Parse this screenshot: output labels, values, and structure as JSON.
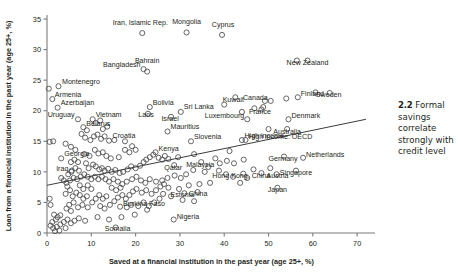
{
  "figure": {
    "caption_number": "2.2",
    "caption_text": "Formal savings correlate strongly with credit level"
  },
  "chart_data": {
    "type": "scatter",
    "title": "",
    "xlabel": "Saved at a financial institution in the past year (age 25+, %)",
    "ylabel": "Loan from a financial institution in the past year (age 25+, %)",
    "xlim": [
      0,
      72
    ],
    "ylim": [
      0,
      35
    ],
    "xticks": [
      0,
      10,
      20,
      30,
      40,
      50,
      60,
      70
    ],
    "yticks": [
      0,
      5,
      10,
      15,
      20,
      25,
      30,
      35
    ],
    "grid": false,
    "legend": null,
    "trendline": {
      "x": [
        0,
        72
      ],
      "y": [
        7.8,
        18.6
      ],
      "label": ""
    },
    "labeled_points": [
      {
        "label": "Iran, Islamic Rep.",
        "x": 21.5,
        "y": 32.7,
        "lx": -2,
        "ly": 8,
        "anchor": "middle"
      },
      {
        "label": "Mongolia",
        "x": 31.5,
        "y": 32.8,
        "lx": 0,
        "ly": 8,
        "anchor": "middle"
      },
      {
        "label": "Cyprus",
        "x": 39.5,
        "y": 32.4,
        "lx": 1,
        "ly": 8,
        "anchor": "middle"
      },
      {
        "label": "Bangladesh",
        "x": 21.8,
        "y": 26.8,
        "lx": -3,
        "ly": 2,
        "anchor": "end"
      },
      {
        "label": "Bahrain",
        "x": 22.6,
        "y": 26.4,
        "lx": 0,
        "ly": 9,
        "anchor": "middle"
      },
      {
        "label": "Montenegro",
        "x": 2.6,
        "y": 24.0,
        "lx": 3.5,
        "ly": 2.5,
        "anchor": "start"
      },
      {
        "label": "Armenia",
        "x": 1.2,
        "y": 21.9,
        "lx": 2.5,
        "ly": 2.5,
        "anchor": "start"
      },
      {
        "label": "Azerbaijan",
        "x": 2.4,
        "y": 20.5,
        "lx": 3,
        "ly": 2.5,
        "anchor": "start"
      },
      {
        "label": "Bolivia",
        "x": 23.2,
        "y": 20.6,
        "lx": 3,
        "ly": 2.5,
        "anchor": "start"
      },
      {
        "label": "Sri Lanka",
        "x": 30.2,
        "y": 19.8,
        "lx": 3,
        "ly": 2.5,
        "anchor": "start"
      },
      {
        "label": "Uruguay",
        "x": 7.0,
        "y": 18.6,
        "lx": -3.5,
        "ly": 2.5,
        "anchor": "end"
      },
      {
        "label": "Vietnam",
        "x": 10.3,
        "y": 18.6,
        "lx": 3,
        "ly": 2.5,
        "anchor": "start"
      },
      {
        "label": "Laos",
        "x": 22.8,
        "y": 19.5,
        "lx": -2,
        "ly": -3.5,
        "anchor": "middle"
      },
      {
        "label": "Israel",
        "x": 28.0,
        "y": 19.0,
        "lx": -1,
        "ly": -4.5,
        "anchor": "middle"
      },
      {
        "label": "Belarus",
        "x": 8.2,
        "y": 17.3,
        "lx": 3,
        "ly": 1.5,
        "anchor": "start"
      },
      {
        "label": "Mauritius",
        "x": 27.2,
        "y": 16.6,
        "lx": 3,
        "ly": 2.5,
        "anchor": "start"
      },
      {
        "label": "Croatia",
        "x": 14.0,
        "y": 15.1,
        "lx": 3.5,
        "ly": 2.5,
        "anchor": "start"
      },
      {
        "label": "Slovenia",
        "x": 32.5,
        "y": 15.0,
        "lx": 3,
        "ly": 2,
        "anchor": "start"
      },
      {
        "label": "High income",
        "x": 44.0,
        "y": 15.2,
        "lx": 2.5,
        "ly": 2,
        "anchor": "start"
      },
      {
        "label": "Georgia",
        "x": 3.2,
        "y": 12.2,
        "lx": 3,
        "ly": 2.5,
        "anchor": "start"
      },
      {
        "label": "Kenya",
        "x": 24.5,
        "y": 13.2,
        "lx": 3,
        "ly": 1.5,
        "anchor": "start"
      },
      {
        "label": "Iraq",
        "x": 5.5,
        "y": 10.0,
        "lx": -3,
        "ly": 1,
        "anchor": "end"
      },
      {
        "label": "Qatar",
        "x": 28.7,
        "y": 11.1,
        "lx": -1,
        "ly": -4.5,
        "anchor": "middle"
      },
      {
        "label": "Malaysia",
        "x": 34.8,
        "y": 11.6,
        "lx": -1,
        "ly": -4.5,
        "anchor": "middle"
      },
      {
        "label": "Kuwait",
        "x": 42.5,
        "y": 22.2,
        "lx": -2,
        "ly": -4.5,
        "anchor": "middle"
      },
      {
        "label": "Canada",
        "x": 50.5,
        "y": 21.6,
        "lx": -3,
        "ly": 1,
        "anchor": "end"
      },
      {
        "label": "France",
        "x": 48.4,
        "y": 20.2,
        "lx": -1.5,
        "ly": -4.5,
        "anchor": "middle"
      },
      {
        "label": "Luxembourg",
        "x": 45.2,
        "y": 18.6,
        "lx": -3,
        "ly": 1,
        "anchor": "end"
      },
      {
        "label": "Finland",
        "x": 56.6,
        "y": 22.2,
        "lx": 3,
        "ly": 1,
        "anchor": "start"
      },
      {
        "label": "Sweden",
        "x": 63.8,
        "y": 22.9,
        "lx": -1,
        "ly": -4.5,
        "anchor": "middle"
      },
      {
        "label": "New Zealand",
        "x": 58.8,
        "y": 28.2,
        "lx": 0,
        "ly": -4.5,
        "anchor": "middle"
      },
      {
        "label": "Denmark",
        "x": 54.5,
        "y": 18.6,
        "lx": 3,
        "ly": 1,
        "anchor": "start"
      },
      {
        "label": "Australia",
        "x": 54.2,
        "y": 17.0,
        "lx": 0,
        "ly": -4.5,
        "anchor": "middle"
      },
      {
        "label": "High income: OECD",
        "x": 44.8,
        "y": 15.2,
        "lx": 3,
        "ly": 1,
        "anchor": "start"
      },
      {
        "label": "Germany",
        "x": 53.5,
        "y": 12.5,
        "lx": -1,
        "ly": -4.5,
        "anchor": "middle"
      },
      {
        "label": "Netherlands",
        "x": 57.8,
        "y": 12.3,
        "lx": 3,
        "ly": 1,
        "anchor": "start"
      },
      {
        "label": "Singapore",
        "x": 56.2,
        "y": 10.2,
        "lx": 0,
        "ly": -4.5,
        "anchor": "middle"
      },
      {
        "label": "Hong Kong, China",
        "x": 44.3,
        "y": 9.7,
        "lx": -2,
        "ly": -4.5,
        "anchor": "middle"
      },
      {
        "label": "Austria",
        "x": 51.8,
        "y": 9.6,
        "lx": 1,
        "ly": -4,
        "anchor": "middle"
      },
      {
        "label": "Japan",
        "x": 52.0,
        "y": 7.4,
        "lx": 0,
        "ly": -4.5,
        "anchor": "middle"
      },
      {
        "label": "Estonia",
        "x": 31.0,
        "y": 6.5,
        "lx": -2,
        "ly": -3.5,
        "anchor": "middle"
      },
      {
        "label": "China",
        "x": 34.0,
        "y": 6.7,
        "lx": 0.5,
        "ly": -3.5,
        "anchor": "middle"
      },
      {
        "label": "Burkina Faso",
        "x": 16.5,
        "y": 4.3,
        "lx": 3,
        "ly": 1,
        "anchor": "start"
      },
      {
        "label": "Nigeria",
        "x": 28.6,
        "y": 2.2,
        "lx": 3,
        "ly": 1,
        "anchor": "start"
      },
      {
        "label": "Somalia",
        "x": 15.5,
        "y": 0.9,
        "lx": 2,
        "ly": -3.5,
        "anchor": "middle"
      }
    ],
    "unlabeled_points": [
      {
        "x": 0.4,
        "y": 23.6
      },
      {
        "x": 0.6,
        "y": 14.9
      },
      {
        "x": 1.4,
        "y": 15.0
      },
      {
        "x": 4.2,
        "y": 14.6
      },
      {
        "x": 5.4,
        "y": 14.1
      },
      {
        "x": 6.4,
        "y": 13.6
      },
      {
        "x": 7.8,
        "y": 16.2
      },
      {
        "x": 8.6,
        "y": 15.6
      },
      {
        "x": 9.0,
        "y": 16.8
      },
      {
        "x": 9.8,
        "y": 15.2
      },
      {
        "x": 10.6,
        "y": 15.8
      },
      {
        "x": 11.4,
        "y": 16.1
      },
      {
        "x": 12.2,
        "y": 15.4
      },
      {
        "x": 12.6,
        "y": 17.0
      },
      {
        "x": 13.0,
        "y": 15.8
      },
      {
        "x": 13.6,
        "y": 17.4
      },
      {
        "x": 11.0,
        "y": 18.0
      },
      {
        "x": 12.0,
        "y": 18.4
      },
      {
        "x": 15.2,
        "y": 15.2
      },
      {
        "x": 17.6,
        "y": 15.0
      },
      {
        "x": 19.2,
        "y": 14.2
      },
      {
        "x": 20.0,
        "y": 13.6
      },
      {
        "x": 18.6,
        "y": 13.2
      },
      {
        "x": 17.6,
        "y": 13.6
      },
      {
        "x": 16.2,
        "y": 12.4
      },
      {
        "x": 9.6,
        "y": 12.6
      },
      {
        "x": 8.4,
        "y": 12.9
      },
      {
        "x": 8.8,
        "y": 11.4
      },
      {
        "x": 9.4,
        "y": 10.6
      },
      {
        "x": 10.4,
        "y": 11.2
      },
      {
        "x": 11.0,
        "y": 10.9
      },
      {
        "x": 11.8,
        "y": 10.4
      },
      {
        "x": 12.4,
        "y": 10.6
      },
      {
        "x": 13.0,
        "y": 10.2
      },
      {
        "x": 13.8,
        "y": 10.5
      },
      {
        "x": 14.6,
        "y": 10.0
      },
      {
        "x": 15.4,
        "y": 10.3
      },
      {
        "x": 16.4,
        "y": 9.8
      },
      {
        "x": 17.2,
        "y": 10.0
      },
      {
        "x": 18.2,
        "y": 10.4
      },
      {
        "x": 19.0,
        "y": 10.9
      },
      {
        "x": 20.0,
        "y": 10.6
      },
      {
        "x": 21.0,
        "y": 11.0
      },
      {
        "x": 21.8,
        "y": 11.6
      },
      {
        "x": 22.4,
        "y": 12.0
      },
      {
        "x": 23.2,
        "y": 12.4
      },
      {
        "x": 24.0,
        "y": 12.8
      },
      {
        "x": 25.2,
        "y": 12.3
      },
      {
        "x": 26.0,
        "y": 12.0
      },
      {
        "x": 26.6,
        "y": 12.6
      },
      {
        "x": 27.4,
        "y": 12.1
      },
      {
        "x": 29.6,
        "y": 12.4
      },
      {
        "x": 33.2,
        "y": 12.9
      },
      {
        "x": 38.0,
        "y": 12.2
      },
      {
        "x": 39.0,
        "y": 11.4
      },
      {
        "x": 38.8,
        "y": 10.2
      },
      {
        "x": 36.4,
        "y": 10.8
      },
      {
        "x": 35.6,
        "y": 10.0
      },
      {
        "x": 33.0,
        "y": 10.3
      },
      {
        "x": 31.4,
        "y": 9.6
      },
      {
        "x": 30.2,
        "y": 9.0
      },
      {
        "x": 28.8,
        "y": 9.4
      },
      {
        "x": 27.2,
        "y": 9.0
      },
      {
        "x": 26.0,
        "y": 8.6
      },
      {
        "x": 24.6,
        "y": 8.4
      },
      {
        "x": 23.2,
        "y": 8.8
      },
      {
        "x": 22.2,
        "y": 8.2
      },
      {
        "x": 21.2,
        "y": 8.6
      },
      {
        "x": 20.2,
        "y": 9.2
      },
      {
        "x": 19.2,
        "y": 8.8
      },
      {
        "x": 18.0,
        "y": 8.4
      },
      {
        "x": 17.0,
        "y": 8.0
      },
      {
        "x": 16.0,
        "y": 8.4
      },
      {
        "x": 15.0,
        "y": 8.8
      },
      {
        "x": 14.0,
        "y": 8.4
      },
      {
        "x": 13.2,
        "y": 8.8
      },
      {
        "x": 12.4,
        "y": 9.2
      },
      {
        "x": 11.6,
        "y": 8.8
      },
      {
        "x": 10.8,
        "y": 9.2
      },
      {
        "x": 10.0,
        "y": 8.8
      },
      {
        "x": 9.2,
        "y": 9.2
      },
      {
        "x": 8.4,
        "y": 9.6
      },
      {
        "x": 7.6,
        "y": 9.2
      },
      {
        "x": 6.8,
        "y": 8.8
      },
      {
        "x": 6.0,
        "y": 9.0
      },
      {
        "x": 5.2,
        "y": 8.6
      },
      {
        "x": 4.4,
        "y": 8.2
      },
      {
        "x": 3.8,
        "y": 8.6
      },
      {
        "x": 3.2,
        "y": 9.0
      },
      {
        "x": 4.8,
        "y": 9.6
      },
      {
        "x": 5.6,
        "y": 10.2
      },
      {
        "x": 6.4,
        "y": 10.6
      },
      {
        "x": 7.2,
        "y": 10.2
      },
      {
        "x": 14.4,
        "y": 12.2
      },
      {
        "x": 13.4,
        "y": 12.6
      },
      {
        "x": 12.6,
        "y": 13.2
      },
      {
        "x": 11.6,
        "y": 13.0
      },
      {
        "x": 10.8,
        "y": 13.6
      },
      {
        "x": 7.0,
        "y": 11.6
      },
      {
        "x": 6.2,
        "y": 12.0
      },
      {
        "x": 5.4,
        "y": 11.6
      },
      {
        "x": 4.6,
        "y": 7.6
      },
      {
        "x": 5.2,
        "y": 7.0
      },
      {
        "x": 4.2,
        "y": 6.4
      },
      {
        "x": 5.8,
        "y": 6.0
      },
      {
        "x": 6.6,
        "y": 6.6
      },
      {
        "x": 7.4,
        "y": 6.2
      },
      {
        "x": 8.2,
        "y": 5.6
      },
      {
        "x": 9.0,
        "y": 6.0
      },
      {
        "x": 6.0,
        "y": 5.0
      },
      {
        "x": 5.0,
        "y": 4.6
      },
      {
        "x": 4.4,
        "y": 4.0
      },
      {
        "x": 5.4,
        "y": 3.6
      },
      {
        "x": 7.0,
        "y": 4.2
      },
      {
        "x": 8.0,
        "y": 4.6
      },
      {
        "x": 9.2,
        "y": 4.2
      },
      {
        "x": 10.2,
        "y": 5.0
      },
      {
        "x": 11.0,
        "y": 5.6
      },
      {
        "x": 11.8,
        "y": 6.2
      },
      {
        "x": 12.6,
        "y": 5.6
      },
      {
        "x": 13.4,
        "y": 6.0
      },
      {
        "x": 12.0,
        "y": 4.4
      },
      {
        "x": 13.0,
        "y": 4.0
      },
      {
        "x": 14.2,
        "y": 4.6
      },
      {
        "x": 15.2,
        "y": 5.2
      },
      {
        "x": 16.0,
        "y": 5.8
      },
      {
        "x": 17.0,
        "y": 6.2
      },
      {
        "x": 17.8,
        "y": 5.6
      },
      {
        "x": 18.6,
        "y": 6.2
      },
      {
        "x": 19.4,
        "y": 6.8
      },
      {
        "x": 20.2,
        "y": 7.2
      },
      {
        "x": 21.4,
        "y": 6.6
      },
      {
        "x": 22.4,
        "y": 7.0
      },
      {
        "x": 23.6,
        "y": 6.4
      },
      {
        "x": 24.6,
        "y": 7.0
      },
      {
        "x": 25.6,
        "y": 7.6
      },
      {
        "x": 26.4,
        "y": 8.0
      },
      {
        "x": 27.4,
        "y": 7.4
      },
      {
        "x": 0.6,
        "y": 5.6
      },
      {
        "x": 0.8,
        "y": 4.6
      },
      {
        "x": 1.6,
        "y": 3.0
      },
      {
        "x": 2.4,
        "y": 2.6
      },
      {
        "x": 3.0,
        "y": 2.9
      },
      {
        "x": 2.0,
        "y": 2.2
      },
      {
        "x": 1.2,
        "y": 1.8
      },
      {
        "x": 0.8,
        "y": 1.2
      },
      {
        "x": 1.4,
        "y": 0.8
      },
      {
        "x": 2.2,
        "y": 1.0
      },
      {
        "x": 3.0,
        "y": 1.4
      },
      {
        "x": 3.8,
        "y": 1.8
      },
      {
        "x": 4.6,
        "y": 2.2
      },
      {
        "x": 5.4,
        "y": 1.6
      },
      {
        "x": 2.8,
        "y": 0.4
      },
      {
        "x": 1.8,
        "y": 0.3
      },
      {
        "x": 4.2,
        "y": 0.8
      },
      {
        "x": 6.2,
        "y": 2.0
      },
      {
        "x": 7.2,
        "y": 2.4
      },
      {
        "x": 8.6,
        "y": 2.0
      },
      {
        "x": 11.4,
        "y": 2.6
      },
      {
        "x": 14.0,
        "y": 2.2
      },
      {
        "x": 16.8,
        "y": 2.6
      },
      {
        "x": 19.8,
        "y": 3.0
      },
      {
        "x": 18.0,
        "y": 4.2
      },
      {
        "x": 19.0,
        "y": 4.6
      },
      {
        "x": 20.6,
        "y": 4.4
      },
      {
        "x": 21.8,
        "y": 5.0
      },
      {
        "x": 23.0,
        "y": 4.4
      },
      {
        "x": 24.2,
        "y": 5.0
      },
      {
        "x": 25.4,
        "y": 5.6
      },
      {
        "x": 22.6,
        "y": 3.8
      },
      {
        "x": 14.6,
        "y": 7.4
      },
      {
        "x": 15.6,
        "y": 7.0
      },
      {
        "x": 16.6,
        "y": 7.4
      },
      {
        "x": 10.0,
        "y": 7.2
      },
      {
        "x": 9.2,
        "y": 7.8
      },
      {
        "x": 8.2,
        "y": 7.2
      },
      {
        "x": 7.4,
        "y": 7.8
      },
      {
        "x": 40.0,
        "y": 21.0
      },
      {
        "x": 44.0,
        "y": 19.8
      },
      {
        "x": 46.8,
        "y": 20.4
      },
      {
        "x": 48.8,
        "y": 20.6
      },
      {
        "x": 49.2,
        "y": 21.6
      },
      {
        "x": 50.0,
        "y": 17.0
      },
      {
        "x": 54.0,
        "y": 22.0
      },
      {
        "x": 60.6,
        "y": 23.0
      },
      {
        "x": 56.4,
        "y": 28.2
      },
      {
        "x": 41.2,
        "y": 13.4
      },
      {
        "x": 40.6,
        "y": 11.8
      },
      {
        "x": 42.2,
        "y": 11.4
      },
      {
        "x": 44.4,
        "y": 12.0
      },
      {
        "x": 40.4,
        "y": 9.6
      },
      {
        "x": 42.0,
        "y": 9.2
      },
      {
        "x": 43.6,
        "y": 8.2
      },
      {
        "x": 45.2,
        "y": 9.0
      },
      {
        "x": 46.6,
        "y": 10.4
      },
      {
        "x": 48.4,
        "y": 9.8
      },
      {
        "x": 50.4,
        "y": 10.6
      },
      {
        "x": 36.8,
        "y": 8.2
      },
      {
        "x": 34.4,
        "y": 8.0
      },
      {
        "x": 32.0,
        "y": 7.8
      },
      {
        "x": 29.8,
        "y": 7.2
      },
      {
        "x": 28.0,
        "y": 6.0
      },
      {
        "x": 26.2,
        "y": 6.4
      },
      {
        "x": 30.6,
        "y": 5.4
      },
      {
        "x": 33.2,
        "y": 5.2
      }
    ]
  }
}
